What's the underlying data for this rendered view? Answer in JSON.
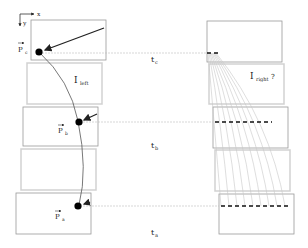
{
  "diagram": {
    "axes": {
      "x_label": "x",
      "y_label": "y"
    },
    "time_labels": {
      "t_c": "t",
      "t_c_sub": "c",
      "t_b": "t",
      "t_b_sub": "b",
      "t_a": "t",
      "t_a_sub": "a"
    },
    "points": {
      "p_c": {
        "name": "P",
        "sub": "c"
      },
      "p_b": {
        "name": "P",
        "sub": "b"
      },
      "p_a": {
        "name": "P",
        "sub": "a"
      }
    },
    "intermediate": {
      "left": {
        "name": "I",
        "sub": "left"
      },
      "right": {
        "name": "I",
        "sub": "right",
        "suffix": " ?"
      }
    },
    "colors": {
      "frame": "#9a9a9a",
      "frame_faint": "#cfcfcf",
      "trajectory": "#555555",
      "point": "#000000",
      "guide": "#bdbdbd",
      "fan": "#c8c8c8",
      "dash": "#111111"
    }
  }
}
